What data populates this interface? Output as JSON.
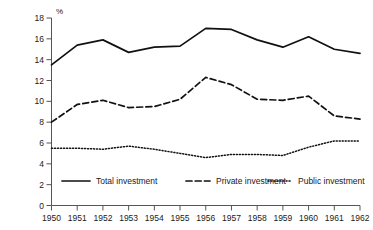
{
  "chart_data": {
    "type": "line",
    "title": "",
    "xlabel": "",
    "ylabel": "%",
    "unit_label": "%",
    "x": [
      1950,
      1951,
      1952,
      1953,
      1954,
      1955,
      1956,
      1957,
      1958,
      1959,
      1960,
      1961,
      1962
    ],
    "categories": [
      "1950",
      "1951",
      "1952",
      "1953",
      "1954",
      "1955",
      "1956",
      "1957",
      "1958",
      "1959",
      "1960",
      "1961",
      "1962"
    ],
    "xlim": [
      1950,
      1962
    ],
    "ylim": [
      0,
      18
    ],
    "yticks": [
      0,
      2,
      4,
      6,
      8,
      10,
      12,
      14,
      16,
      18
    ],
    "ytick_labels": [
      "0",
      "2",
      "4",
      "6",
      "8",
      "10",
      "12",
      "14",
      "16",
      "18"
    ],
    "grid": false,
    "legend_position": "bottom",
    "series": [
      {
        "name": "Total investment",
        "style": "solid",
        "color": "#111111",
        "values": [
          13.5,
          15.4,
          15.9,
          14.7,
          15.2,
          15.3,
          17.0,
          16.9,
          15.9,
          15.2,
          16.2,
          15.0,
          14.6
        ]
      },
      {
        "name": "Private investment",
        "style": "dashed",
        "color": "#111111",
        "values": [
          8.0,
          9.7,
          10.1,
          9.4,
          9.5,
          10.2,
          12.3,
          11.6,
          10.2,
          10.1,
          10.5,
          8.6,
          8.3
        ]
      },
      {
        "name": "Public investment",
        "style": "dotted",
        "color": "#111111",
        "values": [
          5.5,
          5.5,
          5.4,
          5.7,
          5.4,
          5.0,
          4.6,
          4.9,
          4.9,
          4.8,
          5.6,
          6.2,
          6.2
        ]
      }
    ],
    "legend": [
      {
        "label": "Total investment",
        "style": "solid"
      },
      {
        "label": "Private investment",
        "style": "dashed"
      },
      {
        "label": "Public investment",
        "style": "dotted"
      }
    ]
  }
}
